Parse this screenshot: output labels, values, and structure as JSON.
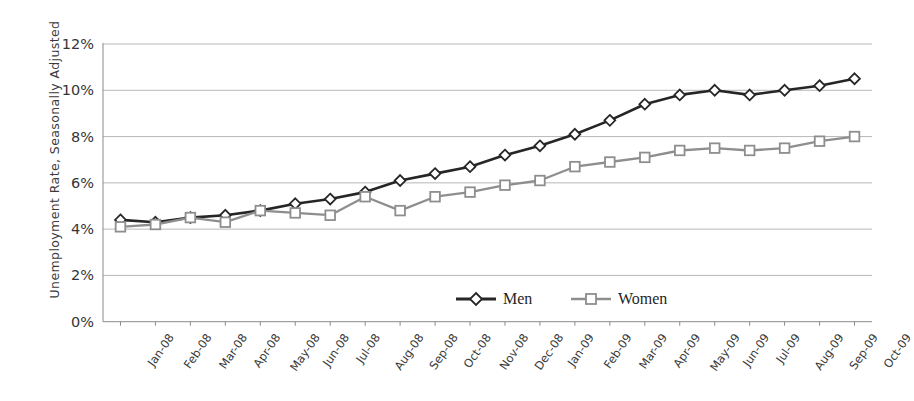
{
  "chart_data": {
    "type": "line",
    "title": "",
    "xlabel": "",
    "ylabel": "Unemployment Rate, Seasonally Adjusted",
    "ylim": [
      0,
      12
    ],
    "ytick_labels": [
      "0%",
      "2%",
      "4%",
      "6%",
      "8%",
      "10%",
      "12%"
    ],
    "ytick_values": [
      0,
      2,
      4,
      6,
      8,
      10,
      12
    ],
    "grid": true,
    "legend_position": "bottom-center",
    "categories": [
      "Jan-08",
      "Feb-08",
      "Mar-08",
      "Apr-08",
      "May-08",
      "Jun-08",
      "Jul-08",
      "Aug-08",
      "Sep-08",
      "Oct-08",
      "Nov-08",
      "Dec-08",
      "Jan-09",
      "Feb-09",
      "Mar-09",
      "Apr-09",
      "May-09",
      "Jun-09",
      "Jul-09",
      "Aug-09",
      "Sep-09",
      "Oct-09"
    ],
    "series": [
      {
        "name": "Men",
        "color": "#262626",
        "marker": "diamond",
        "values": [
          4.4,
          4.3,
          4.5,
          4.6,
          4.8,
          5.1,
          5.3,
          5.6,
          6.1,
          6.4,
          6.7,
          7.2,
          7.6,
          8.1,
          8.7,
          9.4,
          9.8,
          10.0,
          9.8,
          10.0,
          10.2,
          10.5
        ]
      },
      {
        "name": "Women",
        "color": "#8e8e8e",
        "marker": "square",
        "values": [
          4.1,
          4.2,
          4.5,
          4.3,
          4.8,
          4.7,
          4.6,
          5.4,
          4.8,
          5.4,
          5.6,
          5.9,
          6.1,
          6.7,
          6.9,
          7.1,
          7.4,
          7.5,
          7.4,
          7.5,
          7.8,
          8.0
        ]
      }
    ]
  },
  "legend": {
    "items": [
      {
        "label": "Men"
      },
      {
        "label": "Women"
      }
    ]
  }
}
